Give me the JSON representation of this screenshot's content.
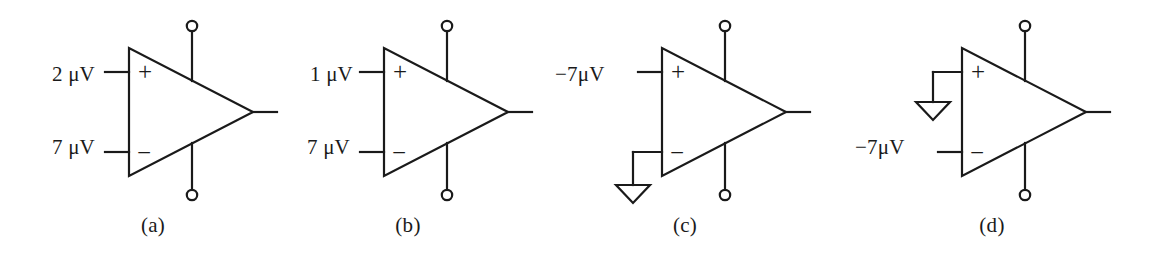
{
  "figure": {
    "background": "#ffffff",
    "stroke_color": "#1a1a1a",
    "panels": [
      {
        "id": "a",
        "caption": "(a)",
        "plus_input": {
          "label": "2 μV",
          "type": "source"
        },
        "minus_input": {
          "label": "7 μV",
          "type": "source"
        },
        "plus_sign": "+",
        "minus_sign": "−",
        "has_positive_supply_pin": true,
        "has_negative_supply_pin": true,
        "has_output_lead": true
      },
      {
        "id": "b",
        "caption": "(b)",
        "plus_input": {
          "label": "1 μV",
          "type": "source"
        },
        "minus_input": {
          "label": "7 μV",
          "type": "source"
        },
        "plus_sign": "+",
        "minus_sign": "−",
        "has_positive_supply_pin": true,
        "has_negative_supply_pin": true,
        "has_output_lead": true
      },
      {
        "id": "c",
        "caption": "(c)",
        "plus_input": {
          "label": "−7μV",
          "type": "source"
        },
        "minus_input": {
          "label": "",
          "type": "ground"
        },
        "plus_sign": "+",
        "minus_sign": "−",
        "has_positive_supply_pin": true,
        "has_negative_supply_pin": true,
        "has_output_lead": true
      },
      {
        "id": "d",
        "caption": "(d)",
        "plus_input": {
          "label": "",
          "type": "ground"
        },
        "minus_input": {
          "label": "−7μV",
          "type": "source"
        },
        "plus_sign": "+",
        "minus_sign": "−",
        "has_positive_supply_pin": true,
        "has_negative_supply_pin": true,
        "has_output_lead": true
      }
    ]
  }
}
